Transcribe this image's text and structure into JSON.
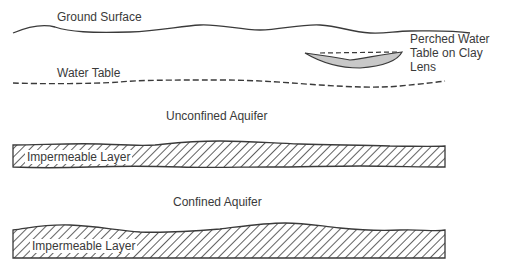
{
  "diagram": {
    "labels": {
      "ground_surface": "Ground Surface",
      "water_table": "Water Table",
      "perched_line1": "Perched Water",
      "perched_line2": "Table on Clay",
      "perched_line3": "Lens",
      "unconfined_aquifer": "Unconfined Aquifer",
      "impermeable_layer_1": "Impermeable Layer",
      "confined_aquifer": "Confined Aquifer",
      "impermeable_layer_2": "Impermeable Layer"
    },
    "colors": {
      "line": "#3a3a3a",
      "clay_lens_fill": "#c8c8c8",
      "background": "#ffffff"
    }
  }
}
